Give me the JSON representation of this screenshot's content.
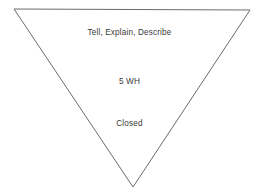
{
  "diagram": {
    "type": "inverted-triangle-funnel",
    "shape_name": "funnel-triangle",
    "background_color": "#ffffff",
    "stroke_color": "#6b6b6b",
    "stroke_width": 1,
    "text_color": "#3a3a3a",
    "vertices": {
      "top_left": [
        14,
        9
      ],
      "top_right": [
        250,
        10
      ],
      "bottom_apex": [
        133,
        187
      ]
    },
    "labels": [
      {
        "text": "Tell, Explain, Describe",
        "level": 1
      },
      {
        "text": "5 WH",
        "level": 2
      },
      {
        "text": "Closed",
        "level": 3
      }
    ]
  }
}
